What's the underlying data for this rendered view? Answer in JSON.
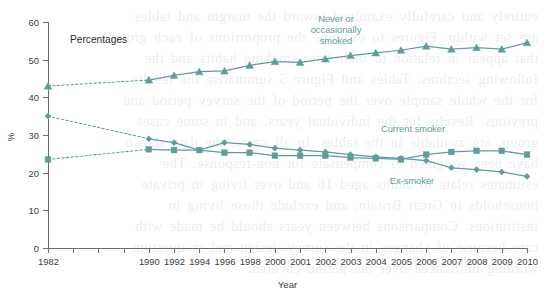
{
  "page": {
    "background_color": "#ffffff",
    "accent_color": "#5f9d9b",
    "axis_color": "#6e6e6e",
    "text_color": "#3b3b3b",
    "panel_note": "Percentages"
  },
  "annotations": {
    "never_or_occasionally_smoked": "Never or\noccasionally\nsmoked",
    "never_line1": "Never or",
    "never_line2": "occasionally",
    "never_line3": "smoked",
    "current_smoker": "Current smoker",
    "ex_smoker": "Ex-smoker"
  },
  "bleed_text": "entirely and carefully examined toward the margin and tables\nare set within. Figures to examine the proportions of each group\nthat appear in relation to their later smoking habits and the\nfollowing sections. Tables and Figure 5 summarise the results\nfor the whole sample over the period of the survey period and\nprevious. Results for the individual years, and in some cases\ngroup, are available in the tables. In all cases, the data shown\nhave been weighted to compensate for non-response. The\nestimates relate to adults aged 16 and over living in private\nhouseholds in Great Britain, and exclude those living in\ninstitutions. Comparisons between years should be made with\ncare because of changes in the survey design and in question\nwording introduced over the period covered.",
  "chart_data": {
    "type": "line",
    "title": "",
    "xlabel": "Year",
    "ylabel": "%",
    "ylim": [
      0,
      60
    ],
    "yticks": [
      0,
      10,
      20,
      30,
      40,
      50,
      60
    ],
    "grid": false,
    "legend": "annotated-inline",
    "x": [
      1982,
      1990,
      1992,
      1994,
      1996,
      1998,
      2000,
      2001,
      2002,
      2003,
      2004,
      2005,
      2006,
      2007,
      2008,
      2009,
      2010
    ],
    "x_tick_labels": [
      "1982",
      "",
      "",
      "",
      "1990",
      "1992",
      "1994",
      "1996",
      "1998",
      "2000",
      "2001",
      "2002",
      "2003",
      "2004",
      "2005",
      "2006",
      "2007",
      "2008",
      "2009",
      "2010"
    ],
    "x_tick_positions": [
      0,
      1,
      2,
      3,
      4,
      5,
      6,
      7,
      8,
      9,
      10,
      11,
      12,
      13,
      14,
      15,
      16,
      17,
      18,
      19
    ],
    "series": [
      {
        "name": "Never or occasionally smoked",
        "marker": "triangle",
        "color": "#5f9d9b",
        "slot_indices": [
          0,
          4,
          5,
          6,
          7,
          8,
          9,
          10,
          11,
          12,
          13,
          14,
          15,
          16,
          17,
          18,
          19
        ],
        "values": [
          43,
          44.6,
          45.8,
          46.8,
          47.0,
          48.5,
          49.5,
          49.3,
          50.2,
          51.1,
          51.8,
          52.5,
          53.6,
          52.8,
          53.2,
          52.8,
          54.5
        ],
        "dashed_from_slot": 0,
        "dashed_to_slot": 4
      },
      {
        "name": "Ex-smoker",
        "marker": "diamond",
        "color": "#5f9d9b",
        "slot_indices": [
          0,
          4,
          5,
          6,
          7,
          8,
          9,
          10,
          11,
          12,
          13,
          14,
          15,
          16,
          17,
          18,
          19
        ],
        "values": [
          35,
          29,
          28,
          26,
          28,
          27.5,
          26.5,
          26,
          25.5,
          24.8,
          24.2,
          23.8,
          23.2,
          21.3,
          20.8,
          20.2,
          19
        ],
        "dashed_from_slot": 0,
        "dashed_to_slot": 4
      },
      {
        "name": "Current smoker",
        "marker": "square",
        "color": "#5f9d9b",
        "slot_indices": [
          0,
          4,
          5,
          6,
          7,
          8,
          9,
          10,
          11,
          12,
          13,
          14,
          15,
          16,
          17,
          18,
          19
        ],
        "values": [
          23.5,
          26.2,
          26.0,
          26.0,
          25.3,
          25.3,
          24.5,
          24.5,
          24.5,
          24.0,
          23.8,
          23.5,
          24.8,
          25.5,
          25.8,
          25.8,
          24.8
        ],
        "dashed_from_slot": 0,
        "dashed_to_slot": 4
      }
    ]
  }
}
